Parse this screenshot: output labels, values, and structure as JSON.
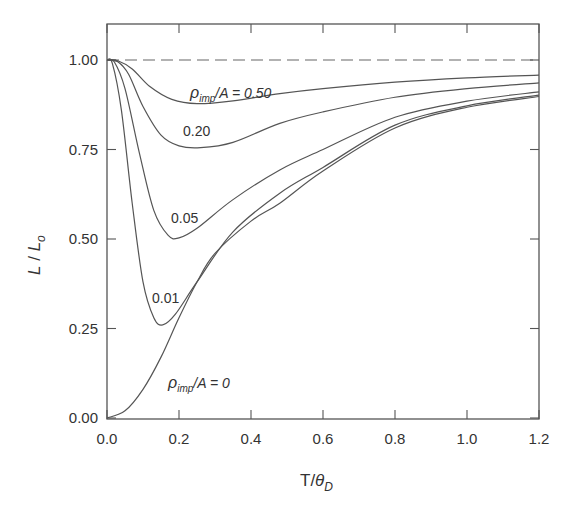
{
  "chart_data": {
    "type": "line",
    "title": "",
    "xlabel": "T/θ_D",
    "ylabel": "L / L_o",
    "xlim": [
      0.0,
      1.2
    ],
    "ylim": [
      0.0,
      1.1
    ],
    "x_ticks": [
      "0.0",
      "0.2",
      "0.4",
      "0.6",
      "0.8",
      "1.0",
      "1.2"
    ],
    "y_ticks": [
      "0.00",
      "0.25",
      "0.50",
      "0.75",
      "1.00"
    ],
    "grid": false,
    "legend": "inline curve labels",
    "reference_line": {
      "y": 1.0,
      "style": "dashed"
    },
    "series": [
      {
        "name": "ρimp/A = 0.50",
        "label": "0.50",
        "points": [
          [
            0,
            1.0
          ],
          [
            0.03,
            0.998
          ],
          [
            0.07,
            0.975
          ],
          [
            0.12,
            0.925
          ],
          [
            0.18,
            0.89
          ],
          [
            0.25,
            0.878
          ],
          [
            0.35,
            0.886
          ],
          [
            0.48,
            0.906
          ],
          [
            0.6,
            0.92
          ],
          [
            0.8,
            0.938
          ],
          [
            1.0,
            0.95
          ],
          [
            1.2,
            0.958
          ]
        ]
      },
      {
        "name": "ρimp/A = 0.20",
        "label": "0.20",
        "points": [
          [
            0,
            1.0
          ],
          [
            0.03,
            0.995
          ],
          [
            0.06,
            0.96
          ],
          [
            0.1,
            0.87
          ],
          [
            0.15,
            0.79
          ],
          [
            0.2,
            0.76
          ],
          [
            0.26,
            0.755
          ],
          [
            0.35,
            0.77
          ],
          [
            0.48,
            0.823
          ],
          [
            0.6,
            0.855
          ],
          [
            0.8,
            0.896
          ],
          [
            1.0,
            0.92
          ],
          [
            1.2,
            0.936
          ]
        ]
      },
      {
        "name": "ρimp/A = 0.05",
        "label": "0.05",
        "points": [
          [
            0,
            1.0
          ],
          [
            0.02,
            0.995
          ],
          [
            0.05,
            0.92
          ],
          [
            0.09,
            0.74
          ],
          [
            0.13,
            0.58
          ],
          [
            0.17,
            0.51
          ],
          [
            0.2,
            0.503
          ],
          [
            0.25,
            0.53
          ],
          [
            0.35,
            0.61
          ],
          [
            0.48,
            0.693
          ],
          [
            0.6,
            0.75
          ],
          [
            0.8,
            0.84
          ],
          [
            1.0,
            0.885
          ],
          [
            1.2,
            0.911
          ]
        ]
      },
      {
        "name": "ρimp/A = 0.01",
        "label": "0.01",
        "points": [
          [
            0,
            1.0
          ],
          [
            0.015,
            0.99
          ],
          [
            0.04,
            0.86
          ],
          [
            0.07,
            0.6
          ],
          [
            0.1,
            0.38
          ],
          [
            0.13,
            0.28
          ],
          [
            0.155,
            0.26
          ],
          [
            0.19,
            0.29
          ],
          [
            0.25,
            0.38
          ],
          [
            0.35,
            0.52
          ],
          [
            0.48,
            0.628
          ],
          [
            0.6,
            0.7
          ],
          [
            0.8,
            0.818
          ],
          [
            1.0,
            0.872
          ],
          [
            1.2,
            0.902
          ]
        ]
      },
      {
        "name": "ρimp/A = 0",
        "label": "ρimp/A = 0",
        "points": [
          [
            0,
            0.0
          ],
          [
            0.05,
            0.02
          ],
          [
            0.1,
            0.08
          ],
          [
            0.15,
            0.17
          ],
          [
            0.2,
            0.28
          ],
          [
            0.25,
            0.38
          ],
          [
            0.3,
            0.46
          ],
          [
            0.4,
            0.55
          ],
          [
            0.48,
            0.6
          ],
          [
            0.6,
            0.69
          ],
          [
            0.8,
            0.81
          ],
          [
            1.0,
            0.868
          ],
          [
            1.2,
            0.898
          ]
        ]
      }
    ]
  },
  "labels": {
    "x_axis_main": "T/",
    "x_axis_theta": "θ",
    "x_axis_sub": "D",
    "y_axis_L": "L",
    "y_axis_slash": " / ",
    "y_axis_L2": "L",
    "y_axis_sub": "o",
    "rho": "ρ",
    "imp": "imp",
    "label_050_rest": "/A = 0.50",
    "label_020": "0.20",
    "label_005": "0.05",
    "label_001": "0.01",
    "label_0_rest": "/A = 0"
  }
}
